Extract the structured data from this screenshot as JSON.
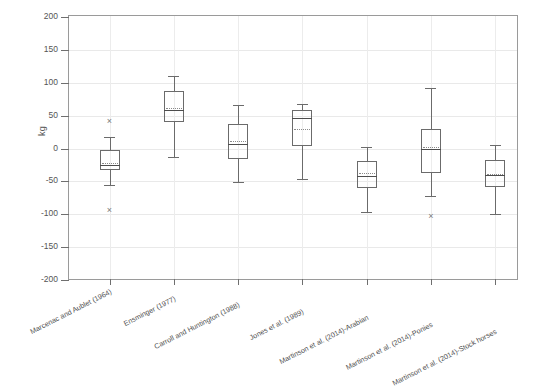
{
  "chart_data": {
    "type": "box",
    "title": "",
    "xlabel": "",
    "ylabel": "kg",
    "ylim": [
      -200,
      200
    ],
    "yticks": [
      200,
      150,
      100,
      50,
      0,
      -50,
      -100,
      -150,
      -200
    ],
    "ytick_labels": [
      "200",
      "150",
      "100",
      "50",
      "0",
      "-50",
      "-100",
      "-150",
      "-200"
    ],
    "grid": true,
    "legend": "none",
    "categories": [
      "Marcenac and Aublet (1964)",
      "Ensminger (1977)",
      "Carroll and Huntington (1988)",
      "Jones et al. (1989)",
      "Martinson et al. (2014)-Arabian",
      "Martinson et al. (2014)-Ponies",
      "Martinson et al. (2014)-Stock horses"
    ],
    "boxes": [
      {
        "category": "Marcenac and Aublet (1964)",
        "whisker_low": -55,
        "q1": -33,
        "median": -25,
        "mean": -22,
        "q3": -3,
        "whisker_high": 18,
        "outliers": [
          41,
          -95
        ]
      },
      {
        "category": "Ensminger (1977)",
        "whisker_low": -13,
        "q1": 40,
        "median": 58,
        "mean": 62,
        "q3": 88,
        "whisker_high": 111,
        "outliers": []
      },
      {
        "category": "Carroll and Huntington (1988)",
        "whisker_low": -51,
        "q1": -16,
        "median": 7,
        "mean": 12,
        "q3": 38,
        "whisker_high": 66,
        "outliers": []
      },
      {
        "category": "Jones et al. (1989)",
        "whisker_low": -46,
        "q1": 4,
        "median": 46,
        "mean": 30,
        "q3": 58,
        "whisker_high": 68,
        "outliers": []
      },
      {
        "category": "Martinson et al. (2014)-Arabian",
        "whisker_low": -97,
        "q1": -60,
        "median": -42,
        "mean": -38,
        "q3": -19,
        "whisker_high": 3,
        "outliers": []
      },
      {
        "category": "Martinson et al. (2014)-Ponies",
        "whisker_low": -72,
        "q1": -37,
        "median": -1,
        "mean": 2,
        "q3": 29,
        "whisker_high": 92,
        "outliers": [
          -104
        ]
      },
      {
        "category": "Martinson et al. (2014)-Stock horses",
        "whisker_low": -99,
        "q1": -59,
        "median": -41,
        "mean": -39,
        "q3": -18,
        "whisker_high": 6,
        "outliers": []
      }
    ],
    "colors": {
      "box_line": "#6b6b6b",
      "median_line": "#4d4d4d",
      "mean_line": "#8a8a8a",
      "grid": "#e9e9e9",
      "frame": "#9a9a9a",
      "outlier": "#7a7a7a",
      "text": "#4f4f4f",
      "background": "#ffffff"
    },
    "outlier_marker": "×"
  }
}
